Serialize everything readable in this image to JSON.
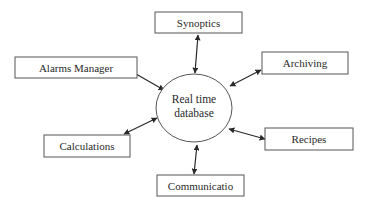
{
  "diagram": {
    "center": {
      "label_line1": "Real time",
      "label_line2": "database",
      "cx": 194,
      "cy": 108,
      "rx": 38,
      "ry": 34
    },
    "nodes": [
      {
        "id": "synoptics",
        "label": "Synoptics",
        "x": 155,
        "y": 12,
        "w": 87,
        "h": 21
      },
      {
        "id": "alarms-manager",
        "label": "Alarms Manager",
        "x": 15,
        "y": 57,
        "w": 122,
        "h": 21
      },
      {
        "id": "archiving",
        "label": "Archiving",
        "x": 262,
        "y": 52,
        "w": 86,
        "h": 22
      },
      {
        "id": "calculations",
        "label": "Calculations",
        "x": 44,
        "y": 135,
        "w": 86,
        "h": 22
      },
      {
        "id": "recipes",
        "label": "Recipes",
        "x": 265,
        "y": 128,
        "w": 88,
        "h": 22
      },
      {
        "id": "communicatio",
        "label": "Communicatio",
        "x": 157,
        "y": 175,
        "w": 87,
        "h": 21
      }
    ],
    "edges": [
      {
        "from": "center",
        "to": "synoptics",
        "bidirectional": true
      },
      {
        "from": "center",
        "to": "alarms-manager",
        "bidirectional": true
      },
      {
        "from": "center",
        "to": "archiving",
        "bidirectional": true
      },
      {
        "from": "center",
        "to": "calculations",
        "bidirectional": true
      },
      {
        "from": "center",
        "to": "recipes",
        "bidirectional": true
      },
      {
        "from": "center",
        "to": "communicatio",
        "bidirectional": true
      }
    ],
    "colors": {
      "stroke": "#3a3a3a",
      "text": "#2a2a2a",
      "background": "#ffffff"
    }
  }
}
